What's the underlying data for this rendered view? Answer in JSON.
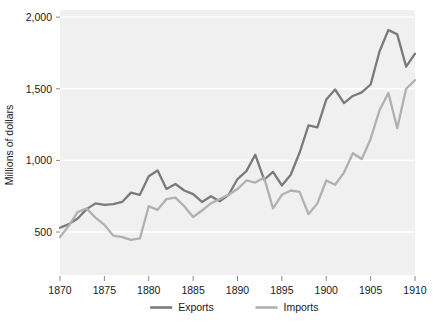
{
  "chart_data": {
    "type": "line",
    "title": "",
    "xlabel": "",
    "ylabel": "Millions of dollars",
    "xlim": [
      1870,
      1910
    ],
    "ylim": [
      200,
      2050
    ],
    "grid": true,
    "legend_position": "bottom",
    "x": [
      1870,
      1871,
      1872,
      1873,
      1874,
      1875,
      1876,
      1877,
      1878,
      1879,
      1880,
      1881,
      1882,
      1883,
      1884,
      1885,
      1886,
      1887,
      1888,
      1889,
      1890,
      1891,
      1892,
      1893,
      1894,
      1895,
      1896,
      1897,
      1898,
      1899,
      1900,
      1901,
      1902,
      1903,
      1904,
      1905,
      1906,
      1907,
      1908,
      1909,
      1910
    ],
    "series": [
      {
        "name": "Exports",
        "color": "#7a7a7a",
        "values": [
          530,
          555,
          595,
          660,
          700,
          690,
          695,
          710,
          775,
          760,
          890,
          930,
          800,
          835,
          790,
          765,
          710,
          750,
          715,
          760,
          870,
          925,
          1040,
          865,
          920,
          825,
          900,
          1055,
          1245,
          1230,
          1425,
          1495,
          1400,
          1450,
          1475,
          1530,
          1760,
          1910,
          1880,
          1655,
          1745
        ]
      },
      {
        "name": "Imports",
        "color": "#b0b0b0",
        "values": [
          465,
          545,
          640,
          665,
          600,
          550,
          475,
          465,
          445,
          455,
          680,
          655,
          730,
          740,
          680,
          605,
          650,
          700,
          730,
          760,
          800,
          860,
          845,
          880,
          665,
          760,
          790,
          780,
          625,
          700,
          860,
          830,
          915,
          1050,
          1010,
          1150,
          1350,
          1470,
          1225,
          1500,
          1560
        ]
      }
    ],
    "yticks": [
      500,
      1000,
      1500,
      2000
    ],
    "ytick_labels": [
      "500",
      "1,000",
      "1,500",
      "2,000"
    ],
    "xticks": [
      1870,
      1875,
      1880,
      1885,
      1890,
      1895,
      1900,
      1905,
      1910
    ],
    "xtick_labels": [
      "1870",
      "1875",
      "1880",
      "1885",
      "1890",
      "1895",
      "1900",
      "1905",
      "1910"
    ]
  },
  "legend": {
    "items": [
      {
        "label": "Exports"
      },
      {
        "label": "Imports"
      }
    ]
  },
  "colors": {
    "exports": "#7a7a7a",
    "imports": "#b0b0b0",
    "plot_background": "#f0f0f0",
    "gridline": "#ffffff",
    "text": "#1a1a1a"
  }
}
